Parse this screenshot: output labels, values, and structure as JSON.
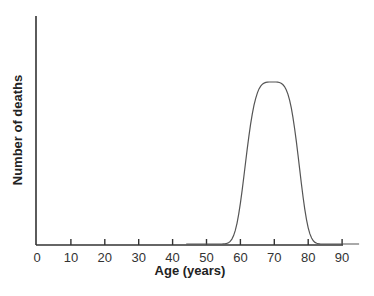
{
  "chart_data": {
    "type": "line",
    "title": "",
    "xlabel": "Age (years)",
    "ylabel": "Number of deaths",
    "xlim": [
      0,
      90
    ],
    "x_ticks": [
      0,
      10,
      20,
      30,
      40,
      50,
      60,
      70,
      80,
      90
    ],
    "y_ticks": [],
    "grid": false,
    "legend": null,
    "series": [
      {
        "name": "Deaths by age",
        "x": [
          45,
          50,
          52,
          55,
          58,
          60,
          62,
          64,
          66,
          68,
          69.5,
          71,
          73,
          75,
          77,
          80,
          82,
          85,
          88,
          90,
          92
        ],
        "y": [
          0,
          0.01,
          0.04,
          0.12,
          0.28,
          0.42,
          0.6,
          0.78,
          0.92,
          0.99,
          1.0,
          0.98,
          0.88,
          0.72,
          0.52,
          0.25,
          0.12,
          0.04,
          0.01,
          0.005,
          0.0
        ],
        "y_units": "relative (peak = 1.0, axis unlabeled)"
      }
    ],
    "annotations": [
      "Peak number of deaths at approximately age 70"
    ]
  },
  "axes": {
    "x_title": "Age (years)",
    "y_title": "Number of deaths",
    "x_tick_labels": [
      "0",
      "10",
      "20",
      "30",
      "40",
      "50",
      "60",
      "70",
      "80",
      "90"
    ]
  },
  "colors": {
    "axis": "#333333",
    "curve": "#555555",
    "text": "#222222"
  }
}
